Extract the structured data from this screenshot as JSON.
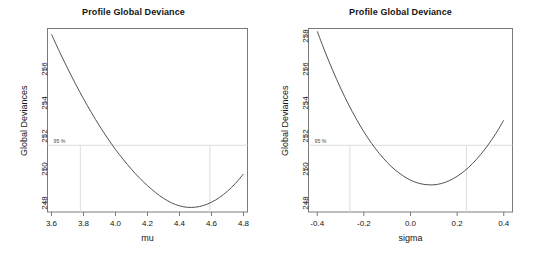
{
  "figure": {
    "width": 534,
    "height": 256,
    "background": "#ffffff",
    "line_color": "#3d3d3d",
    "axis_color": "#7a7a7a",
    "ci_line_color": "#d9d9d9",
    "text_color": "#141414"
  },
  "chart_data": [
    {
      "type": "line",
      "panel": "left",
      "title": "Profile Global Deviance",
      "xlabel": "mu",
      "ylabel": "Global Deviances",
      "xlim": [
        3.575,
        4.825
      ],
      "ylim": [
        247.45,
        258.45
      ],
      "xticks": [
        3.6,
        3.8,
        4.0,
        4.2,
        4.4,
        4.6,
        4.8
      ],
      "xticklabels": [
        "3.6",
        "3.8",
        "4.0",
        "4.2",
        "4.4",
        "4.6",
        "4.8"
      ],
      "yticks": [
        248,
        250,
        252,
        254,
        256
      ],
      "yticklabels": [
        "248",
        "250",
        "252",
        "254",
        "256"
      ],
      "grid": false,
      "legend": "none",
      "annotations": [
        {
          "label": "95 %",
          "type": "confidence-interval",
          "hline_y": 251.45,
          "vline_x": [
            3.78,
            4.59
          ]
        }
      ],
      "x": [
        3.6,
        3.65,
        3.7,
        3.75,
        3.8,
        3.85,
        3.9,
        3.95,
        4.0,
        4.05,
        4.1,
        4.15,
        4.2,
        4.25,
        4.3,
        4.35,
        4.4,
        4.45,
        4.5,
        4.55,
        4.6,
        4.65,
        4.7,
        4.75,
        4.8
      ],
      "values": [
        258.1,
        257.06,
        256.07,
        255.13,
        254.24,
        253.4,
        252.61,
        251.88,
        251.2,
        250.58,
        250.01,
        249.49,
        249.03,
        248.62,
        248.27,
        248.0,
        247.82,
        247.73,
        247.74,
        247.84,
        248.04,
        248.32,
        248.7,
        249.17,
        249.73
      ]
    },
    {
      "type": "line",
      "panel": "right",
      "title": "Profile Global Deviance",
      "xlabel": "sigma",
      "ylabel": "Global Deviances",
      "xlim": [
        -0.4375,
        0.4375
      ],
      "ylim": [
        247.45,
        258.45
      ],
      "xticks": [
        -0.4,
        -0.2,
        0.0,
        0.2,
        0.4
      ],
      "xticklabels": [
        "-0.4",
        "-0.2",
        "0.0",
        "0.2",
        "0.4"
      ],
      "yticks": [
        248,
        250,
        252,
        254,
        256,
        258
      ],
      "yticklabels": [
        "248",
        "250",
        "252",
        "254",
        "256",
        "258"
      ],
      "grid": false,
      "legend": "none",
      "annotations": [
        {
          "label": "95 %",
          "type": "confidence-interval",
          "hline_y": 251.45,
          "vline_x": [
            -0.26,
            0.24
          ]
        }
      ],
      "x": [
        -0.4,
        -0.3667,
        -0.3333,
        -0.3,
        -0.2667,
        -0.2333,
        -0.2,
        -0.1667,
        -0.1333,
        -0.1,
        -0.0667,
        -0.0333,
        0.0,
        0.0333,
        0.0667,
        0.1,
        0.1333,
        0.1667,
        0.2,
        0.2333,
        0.2667,
        0.3,
        0.3333,
        0.3667,
        0.4
      ],
      "values": [
        258.28,
        257.06,
        255.93,
        254.88,
        253.92,
        253.05,
        252.26,
        251.56,
        250.95,
        250.42,
        249.98,
        249.63,
        249.36,
        249.18,
        249.09,
        249.08,
        249.16,
        249.33,
        249.59,
        249.93,
        250.36,
        250.88,
        251.48,
        252.17,
        252.95
      ]
    }
  ],
  "panels": {
    "left": {
      "title": "Profile Global Deviance",
      "xlabel": "mu",
      "ylabel": "Global Deviances",
      "ci_label": "95 %",
      "xticklabels": [
        "3.6",
        "3.8",
        "4.0",
        "4.2",
        "4.4",
        "4.6",
        "4.8"
      ],
      "yticklabels": [
        "248",
        "250",
        "252",
        "254",
        "256"
      ]
    },
    "right": {
      "title": "Profile Global Deviance",
      "xlabel": "sigma",
      "ylabel": "Global Deviances",
      "ci_label": "95 %",
      "xticklabels": [
        "-0.4",
        "-0.2",
        "0.0",
        "0.2",
        "0.4"
      ],
      "yticklabels": [
        "248",
        "250",
        "252",
        "254",
        "256",
        "258"
      ]
    }
  }
}
